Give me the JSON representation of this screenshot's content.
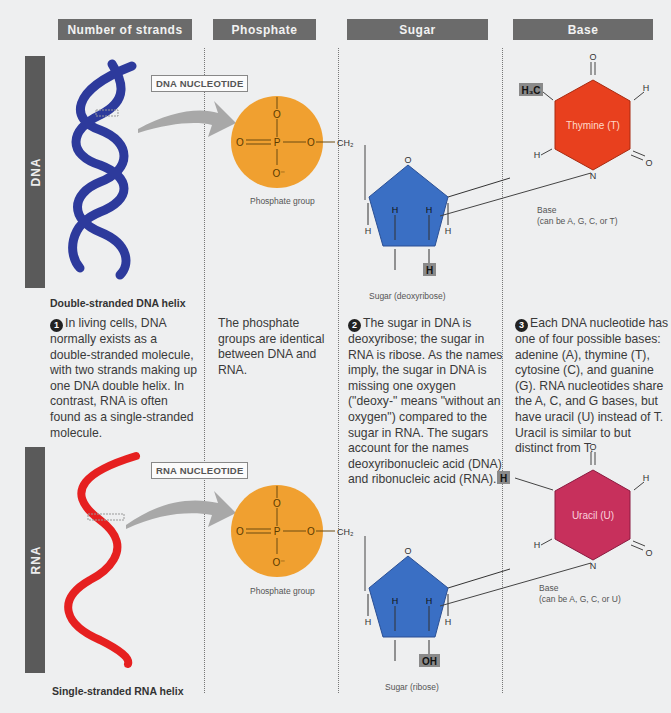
{
  "headers": [
    "Number of strands",
    "Phosphate",
    "Sugar",
    "Base"
  ],
  "rows": [
    {
      "label": "DNA",
      "nucleotide_tag": "DNA NUCLEOTIDE",
      "helix_caption": "Double-stranded DNA helix",
      "helix_color": "#2d3a9c",
      "phosphate_caption": "Phosphate group",
      "sugar_caption": "Sugar (deoxyribose)",
      "sugar_highlight": "H",
      "base_name": "Thymine (T)",
      "base_color": "#e8401e",
      "base_highlight": "H3C",
      "base_caption_1": "Base",
      "base_caption_2": "(can be A, G, C, or T)"
    },
    {
      "label": "RNA",
      "nucleotide_tag": "RNA NUCLEOTIDE",
      "helix_caption": "Single-stranded RNA helix",
      "helix_color": "#e62020",
      "phosphate_caption": "Phosphate group",
      "sugar_caption": "Sugar (ribose)",
      "sugar_highlight": "OH",
      "base_name": "Uracil (U)",
      "base_color": "#c7305c",
      "base_highlight": "H",
      "base_caption_1": "Base",
      "base_caption_2": "(can be A, G, C, or U)"
    }
  ],
  "notes": {
    "strands": {
      "number": "1",
      "text": "In living cells, DNA normally exists as a double-stranded molecule, with two strands making up one DNA double helix. In contrast, RNA is often found as a single-stranded molecule."
    },
    "phosphate": {
      "text": "The phosphate groups are identical between DNA and RNA."
    },
    "sugar": {
      "number": "2",
      "text": "The sugar in DNA is deoxyribose; the sugar in RNA is ribose. As the names imply, the sugar in DNA is missing one oxygen (\"deoxy-\" means \"without an oxygen\") compared to the sugar in RNA. The sugars account for the names deoxyribonucleic acid (DNA) and ribonucleic acid (RNA)."
    },
    "base": {
      "number": "3",
      "text": "Each DNA nucleotide has one of four possible bases: adenine (A), thymine (T), cytosine (C), and guanine (G). RNA nucleotides share the A, C, and G bases, but have uracil (U) instead of T. Uracil is similar to but distinct from T."
    }
  },
  "atoms": {
    "O": "O",
    "P": "P",
    "O_minus": "O⁻",
    "CH2": "CH₂",
    "C": "C",
    "H": "H",
    "N": "N"
  },
  "colors": {
    "header_bg": "#6b6b6b",
    "phosphate": "#f0a030",
    "sugar": "#3a6fc4",
    "arrow": "#a8a8a8"
  }
}
